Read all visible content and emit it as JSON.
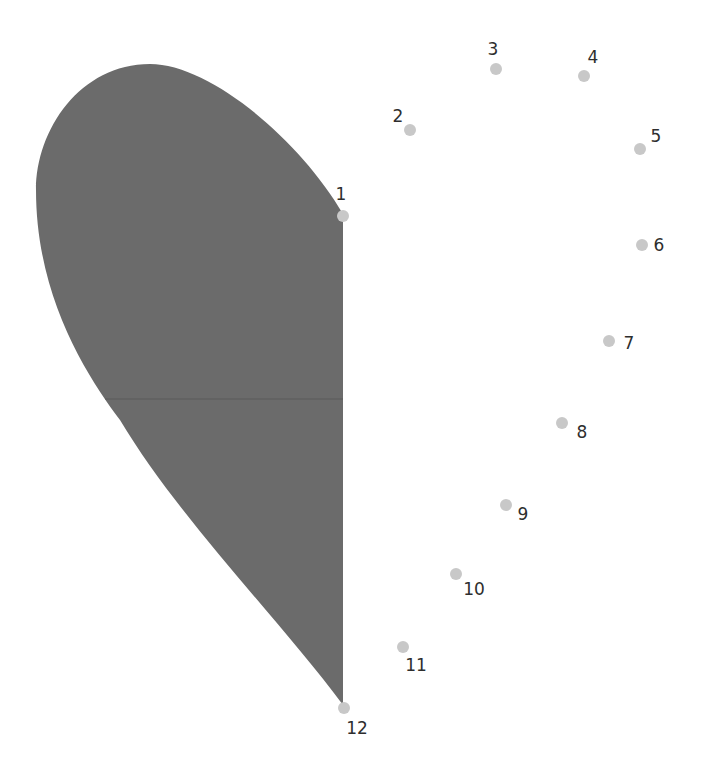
{
  "puzzle": {
    "type": "connect-the-dots",
    "colors": {
      "shape_fill": "#6b6b6b",
      "dot": "#c8c8c8",
      "label": "#2e2e2e",
      "background": "#ffffff"
    },
    "shape": {
      "description": "half-heart left side filled gray",
      "path": "M343,214 C300,140 210,64 150,64 C80,64 36,130 36,190 C36,300 90,380 120,420 C180,520 280,620 343,705 Z",
      "midline_y": 399
    },
    "points": [
      {
        "n": "1",
        "x": 343,
        "y": 216,
        "lx": 341,
        "ly": 194
      },
      {
        "n": "2",
        "x": 410,
        "y": 130,
        "lx": 398,
        "ly": 116
      },
      {
        "n": "3",
        "x": 496,
        "y": 69,
        "lx": 493,
        "ly": 49
      },
      {
        "n": "4",
        "x": 584,
        "y": 76,
        "lx": 593,
        "ly": 57
      },
      {
        "n": "5",
        "x": 640,
        "y": 149,
        "lx": 656,
        "ly": 136
      },
      {
        "n": "6",
        "x": 642,
        "y": 245,
        "lx": 659,
        "ly": 245
      },
      {
        "n": "7",
        "x": 609,
        "y": 341,
        "lx": 629,
        "ly": 343
      },
      {
        "n": "8",
        "x": 562,
        "y": 423,
        "lx": 582,
        "ly": 432
      },
      {
        "n": "9",
        "x": 506,
        "y": 505,
        "lx": 523,
        "ly": 514
      },
      {
        "n": "10",
        "x": 456,
        "y": 574,
        "lx": 474,
        "ly": 589
      },
      {
        "n": "11",
        "x": 403,
        "y": 647,
        "lx": 416,
        "ly": 665
      },
      {
        "n": "12",
        "x": 344,
        "y": 708,
        "lx": 357,
        "ly": 728
      }
    ]
  }
}
